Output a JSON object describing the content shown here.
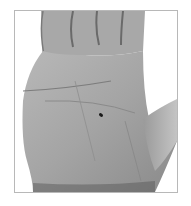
{
  "image": {
    "subject": "Grayscale photograph of an open left palm with a small dark mole near the center",
    "colors": {
      "skin_light": "#b4b4b4",
      "skin_mid": "#9a9a9a",
      "skin_dark": "#6e6e6e",
      "mole": "#1a1a1a",
      "border": "#b8b8b8",
      "background": "#ffffff"
    }
  }
}
